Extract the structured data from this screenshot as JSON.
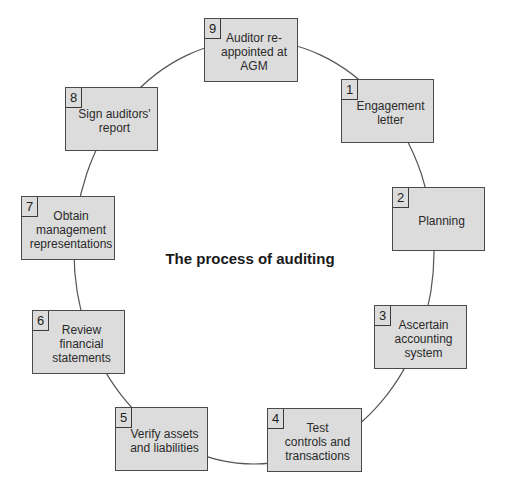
{
  "diagram": {
    "title": "The process of auditing",
    "type": "cycle",
    "colors": {
      "box_fill": "#dcdcdc",
      "box_border": "#4a4a4a",
      "connector": "#555555",
      "text": "#2a2a2a"
    },
    "steps": [
      {
        "number": "1",
        "label": "Engagement\nletter"
      },
      {
        "number": "2",
        "label": "Planning"
      },
      {
        "number": "3",
        "label": "Ascertain\naccounting\nsystem"
      },
      {
        "number": "4",
        "label": "Test\ncontrols and\ntransactions"
      },
      {
        "number": "5",
        "label": "Verify assets\nand liabilities"
      },
      {
        "number": "6",
        "label": "Review\nfinancial\nstatements"
      },
      {
        "number": "7",
        "label": "Obtain\nmanagement\nrepresentations"
      },
      {
        "number": "8",
        "label": "Sign auditors'\nreport"
      },
      {
        "number": "9",
        "label": "Auditor re-\nappointed at\nAGM"
      }
    ]
  }
}
